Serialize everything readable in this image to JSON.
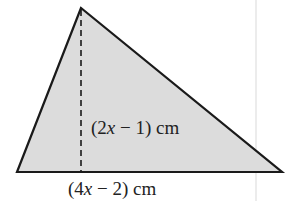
{
  "figure": {
    "shape": "triangle",
    "fill_color": "#dcdcdc",
    "stroke_color": "#1a1a1a",
    "vertices": {
      "apex": [
        81,
        8
      ],
      "bottom_left": [
        17,
        172
      ],
      "bottom_right": [
        282,
        172
      ]
    },
    "height_line": {
      "style": "dashed",
      "x": 81,
      "y1": 8,
      "y2": 172
    },
    "labels": {
      "height": {
        "prefix": "(2",
        "var": "x",
        "suffix": " − 1) cm"
      },
      "base": {
        "prefix": "(4",
        "var": "x",
        "suffix": " − 2) cm"
      }
    }
  }
}
